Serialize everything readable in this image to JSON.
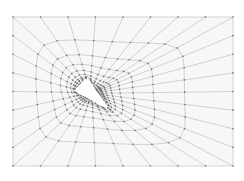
{
  "diagram": {
    "type": "quadrilateral-mesh",
    "canvas": {
      "width": 244,
      "height": 181,
      "background": "#ffffff"
    },
    "domain": {
      "x0": 13,
      "y0": 17,
      "x1": 233,
      "y1": 166,
      "fill": "#f7f7f7"
    },
    "outer_nodes_per_side": 9,
    "hole": {
      "shape": "triangle",
      "vertices": [
        [
          73,
          91
        ],
        [
          87,
          76
        ],
        [
          113,
          113
        ]
      ],
      "fill": "#ffffff"
    },
    "refinement": {
      "rings": 9,
      "ring_growth": 1.55,
      "first_ring_offset": 2.2
    },
    "style": {
      "edge_color": "#a9a9a9",
      "edge_width": 0.5,
      "node_color": "#6f6f6f",
      "node_radius": 0.8
    }
  }
}
